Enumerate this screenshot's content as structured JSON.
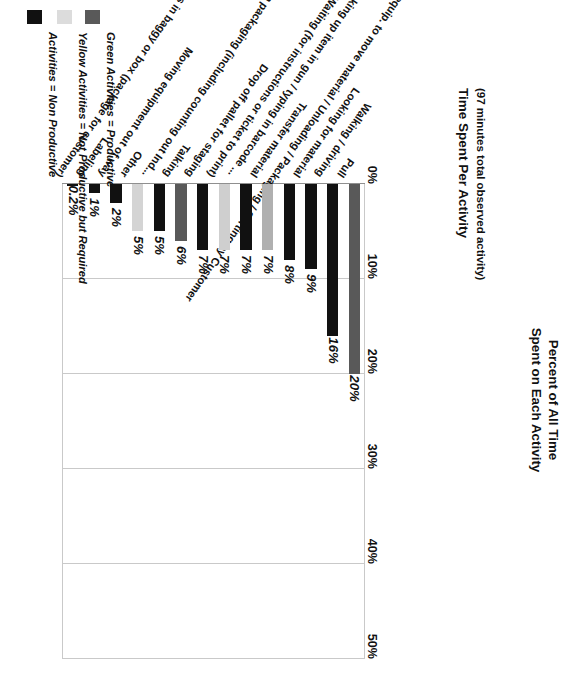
{
  "chart": {
    "title": "Time Spent Per Activity",
    "subtitle": "(97 minutes total observed activity)",
    "axis_title_line1": "Percent of All Time",
    "axis_title_line2": "Spent on Each Activity"
  },
  "legend": {
    "items": [
      {
        "label": "Green Activities = Productive",
        "color": "#595959",
        "swatch_name": "productive-swatch"
      },
      {
        "label": "Yellow Activities = Not Productive but Required",
        "color": "#dcdcdc",
        "swatch_name": "not-productive-but-required-swatch"
      },
      {
        "label": "Activities = Non Productive",
        "color": "#111111",
        "swatch_name": "non-productive-swatch"
      }
    ]
  },
  "chart_data": {
    "type": "bar",
    "title": "Time Spent Per Activity",
    "subtitle": "(97 minutes total observed activity)",
    "xlabel": "",
    "ylabel": "Percent of All Time Spent on Each Activity",
    "ylim": [
      0,
      50
    ],
    "yticks": [
      0,
      10,
      20,
      30,
      40,
      50
    ],
    "ytick_labels": [
      "0%",
      "10%",
      "20%",
      "30%",
      "40%",
      "50%"
    ],
    "grid": true,
    "orientation": "vertical",
    "legend_position": "right",
    "categories": [
      "Pull",
      "Walking / driving",
      "Looking for material",
      "Getting / using equip. to move material / Unloading / Packaging / Sorting by Customer",
      "Transfer material",
      "Scanning / looking up item in gun / typing in barcode ...",
      "Waiting (for instructions or ticket to print)",
      "Drop off pallet for staging",
      "Talking",
      "Breaking down packaging (including counting out Ind...",
      "Other",
      "Moving equipment out of way",
      "Labeling",
      "Put parts in baggy or box (package for customer)"
    ],
    "values": [
      20,
      16,
      9,
      8,
      7,
      7,
      7,
      7,
      6,
      5,
      5,
      2,
      1,
      0.2
    ],
    "value_labels": [
      "20%",
      "16%",
      "9%",
      "8%",
      "7%",
      "7%",
      "7%",
      "7%",
      "6%",
      "5%",
      "5%",
      "2%",
      "1%",
      "0.2%"
    ],
    "bar_colors": [
      "#595959",
      "#111111",
      "#111111",
      "#111111",
      "#b0b0b0",
      "#111111",
      "#cfcfcf",
      "#111111",
      "#595959",
      "#111111",
      "#d4d4d4",
      "#111111",
      "#111111",
      "#111111"
    ],
    "series_legend_map": [
      "Green Activities = Productive",
      "Activities = Non Productive",
      "Activities = Non Productive",
      "Activities = Non Productive",
      "Yellow Activities = Not Productive but Required",
      "Activities = Non Productive",
      "Yellow Activities = Not Productive but Required",
      "Activities = Non Productive",
      "Green Activities = Productive",
      "Activities = Non Productive",
      "Yellow Activities = Not Productive but Required",
      "Activities = Non Productive",
      "Activities = Non Productive",
      "Activities = Non Productive"
    ]
  }
}
